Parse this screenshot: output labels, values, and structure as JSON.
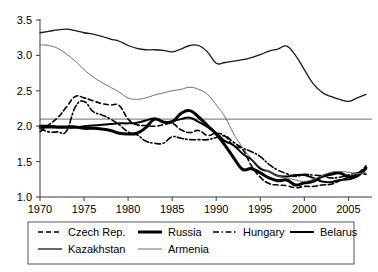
{
  "chart_data": {
    "type": "line",
    "title": "",
    "xlabel": "",
    "ylabel": "",
    "xlim": [
      1970,
      2007
    ],
    "ylim": [
      1.0,
      3.5
    ],
    "ytick_labels": [
      "1.0",
      "1.5",
      "2.0",
      "2.5",
      "3.0",
      "3.5"
    ],
    "ytick_values": [
      1.0,
      1.5,
      2.0,
      2.5,
      3.0,
      3.5
    ],
    "xtick_labels": [
      "1970",
      "1975",
      "1980",
      "1985",
      "1990",
      "1995",
      "2000",
      "2005"
    ],
    "xtick_values": [
      1970,
      1975,
      1980,
      1985,
      1990,
      1995,
      2000,
      2005
    ],
    "grid": false,
    "reference_line": {
      "name": "replacement-level",
      "value": 2.1,
      "color": "#8a8a8a"
    },
    "legend_position": "bottom",
    "legend_entries": [
      {
        "label": "Czech Rep.",
        "style": "dashed",
        "width": 1.6,
        "color": "#000000"
      },
      {
        "label": "Russia",
        "style": "solid",
        "width": 3.0,
        "color": "#000000"
      },
      {
        "label": "Hungary",
        "style": "dashdot",
        "width": 1.6,
        "color": "#000000"
      },
      {
        "label": "Belarus",
        "style": "solid",
        "width": 2.0,
        "color": "#000000"
      },
      {
        "label": "Kazakhstan",
        "style": "solid",
        "width": 1.3,
        "color": "#1a1a1a"
      },
      {
        "label": "Armenia",
        "style": "solid",
        "width": 1.0,
        "color": "#6e6e6e"
      }
    ],
    "x": [
      1970,
      1971,
      1972,
      1973,
      1974,
      1975,
      1976,
      1977,
      1978,
      1979,
      1980,
      1981,
      1982,
      1983,
      1984,
      1985,
      1986,
      1987,
      1988,
      1989,
      1990,
      1991,
      1992,
      1993,
      1994,
      1995,
      1996,
      1997,
      1998,
      1999,
      2000,
      2001,
      2002,
      2003,
      2004,
      2005,
      2006,
      2007
    ],
    "series": [
      {
        "name": "Czech Rep.",
        "style": "dashed",
        "width": 1.6,
        "color": "#000000",
        "values": [
          1.92,
          2.02,
          2.12,
          2.27,
          2.42,
          2.4,
          2.36,
          2.32,
          2.3,
          2.29,
          2.1,
          2.02,
          2.01,
          2.0,
          2.02,
          2.04,
          1.95,
          1.91,
          1.94,
          1.87,
          1.9,
          1.86,
          1.72,
          1.67,
          1.44,
          1.28,
          1.19,
          1.17,
          1.16,
          1.13,
          1.15,
          1.15,
          1.17,
          1.18,
          1.23,
          1.28,
          1.33,
          1.44
        ]
      },
      {
        "name": "Russia",
        "style": "solid",
        "width": 3.0,
        "color": "#000000",
        "values": [
          2.0,
          2.0,
          1.99,
          1.99,
          1.99,
          1.97,
          1.97,
          1.96,
          1.94,
          1.9,
          1.89,
          1.9,
          1.98,
          2.1,
          2.06,
          2.06,
          2.18,
          2.22,
          2.13,
          2.01,
          1.89,
          1.73,
          1.55,
          1.39,
          1.4,
          1.34,
          1.27,
          1.23,
          1.24,
          1.17,
          1.2,
          1.22,
          1.29,
          1.32,
          1.34,
          1.29,
          1.3,
          1.41
        ]
      },
      {
        "name": "Hungary",
        "style": "dashdot",
        "width": 1.6,
        "color": "#000000",
        "values": [
          1.97,
          1.92,
          1.92,
          1.93,
          2.27,
          2.35,
          2.21,
          2.16,
          2.1,
          2.02,
          1.92,
          1.88,
          1.79,
          1.76,
          1.76,
          1.85,
          1.83,
          1.81,
          1.81,
          1.81,
          1.84,
          1.86,
          1.77,
          1.69,
          1.64,
          1.57,
          1.46,
          1.38,
          1.33,
          1.29,
          1.32,
          1.31,
          1.3,
          1.27,
          1.28,
          1.31,
          1.34,
          1.32
        ]
      },
      {
        "name": "Belarus",
        "style": "solid",
        "width": 2.0,
        "color": "#000000",
        "values": [
          1.98,
          1.98,
          1.98,
          1.98,
          1.98,
          2.0,
          2.01,
          2.02,
          2.03,
          2.04,
          2.04,
          2.05,
          2.08,
          2.11,
          2.06,
          2.07,
          2.1,
          2.12,
          2.06,
          1.99,
          1.9,
          1.79,
          1.73,
          1.61,
          1.53,
          1.4,
          1.36,
          1.3,
          1.29,
          1.31,
          1.31,
          1.27,
          1.22,
          1.21,
          1.24,
          1.25,
          1.29,
          1.4
        ]
      },
      {
        "name": "Kazakhstan",
        "style": "solid",
        "width": 1.3,
        "color": "#1a1a1a",
        "values": [
          3.32,
          3.34,
          3.36,
          3.37,
          3.35,
          3.32,
          3.3,
          3.27,
          3.23,
          3.2,
          3.14,
          3.1,
          3.08,
          3.08,
          3.07,
          3.05,
          3.09,
          3.14,
          3.14,
          3.05,
          2.89,
          2.9,
          2.92,
          2.94,
          2.97,
          3.01,
          3.06,
          3.09,
          3.13,
          3.0,
          2.8,
          2.6,
          2.48,
          2.42,
          2.38,
          2.35,
          2.4,
          2.45
        ]
      },
      {
        "name": "Armenia",
        "style": "solid",
        "width": 1.0,
        "color": "#6e6e6e",
        "values": [
          3.15,
          3.14,
          3.1,
          3.02,
          2.92,
          2.8,
          2.7,
          2.62,
          2.55,
          2.48,
          2.4,
          2.38,
          2.4,
          2.44,
          2.47,
          2.5,
          2.52,
          2.55,
          2.52,
          2.45,
          2.3,
          2.13,
          1.89,
          1.7,
          1.54,
          1.42,
          1.36,
          1.3,
          1.27,
          1.24,
          1.22,
          1.25,
          1.3,
          1.35,
          1.36,
          1.35,
          1.33,
          1.35
        ]
      }
    ]
  }
}
